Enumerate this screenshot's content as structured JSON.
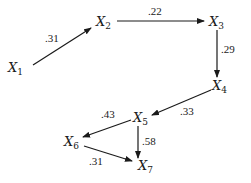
{
  "diagram": {
    "type": "path-diagram",
    "nodes": [
      {
        "id": "X1",
        "label": "X",
        "sub": "1",
        "x": 8,
        "y": 72
      },
      {
        "id": "X2",
        "label": "X",
        "sub": "2",
        "x": 96,
        "y": 26
      },
      {
        "id": "X3",
        "label": "X",
        "sub": "3",
        "x": 209,
        "y": 26
      },
      {
        "id": "X4",
        "label": "X",
        "sub": "4",
        "x": 212,
        "y": 90
      },
      {
        "id": "X5",
        "label": "X",
        "sub": "5",
        "x": 133,
        "y": 122
      },
      {
        "id": "X6",
        "label": "X",
        "sub": "6",
        "x": 64,
        "y": 146
      },
      {
        "id": "X7",
        "label": "X",
        "sub": "7",
        "x": 138,
        "y": 170
      }
    ],
    "edges": [
      {
        "from": "X1",
        "to": "X2",
        "coef": ".31",
        "x1": 33,
        "y1": 65,
        "x2": 91,
        "y2": 28,
        "lx": 45,
        "ly": 42
      },
      {
        "from": "X2",
        "to": "X3",
        "coef": ".22",
        "x1": 117,
        "y1": 21,
        "x2": 204,
        "y2": 21,
        "lx": 148,
        "ly": 15
      },
      {
        "from": "X3",
        "to": "X4",
        "coef": ".29",
        "x1": 217,
        "y1": 30,
        "x2": 217,
        "y2": 77,
        "lx": 221,
        "ly": 53
      },
      {
        "from": "X4",
        "to": "X5",
        "coef": ".33",
        "x1": 211,
        "y1": 90,
        "x2": 152,
        "y2": 115,
        "lx": 180,
        "ly": 115
      },
      {
        "from": "X5",
        "to": "X6",
        "coef": ".43",
        "x1": 131,
        "y1": 120,
        "x2": 83,
        "y2": 137,
        "lx": 101,
        "ly": 118
      },
      {
        "from": "X5",
        "to": "X7",
        "coef": ".58",
        "x1": 138,
        "y1": 126,
        "x2": 138,
        "y2": 158,
        "lx": 142,
        "ly": 145
      },
      {
        "from": "X6",
        "to": "X7",
        "coef": ".31",
        "x1": 84,
        "y1": 146,
        "x2": 132,
        "y2": 161,
        "lx": 89,
        "ly": 165
      }
    ]
  }
}
